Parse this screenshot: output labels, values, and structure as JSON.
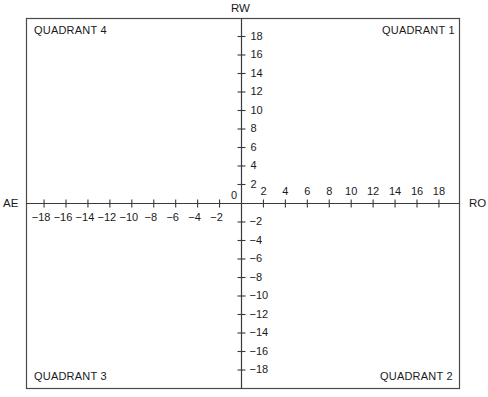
{
  "chart_data": {
    "type": "scatter",
    "title": "",
    "xlabel_positive": "RO",
    "xlabel_negative": "AE",
    "ylabel_positive": "RW",
    "origin_label": "0",
    "xlim": [
      -20,
      20
    ],
    "ylim": [
      -20,
      20
    ],
    "grid": false,
    "x_ticks_positive": [
      2,
      4,
      6,
      8,
      10,
      12,
      14,
      16,
      18
    ],
    "x_ticks_negative": [
      -18,
      -16,
      -14,
      -12,
      -10,
      -8,
      -6,
      -4,
      -2
    ],
    "y_ticks_positive": [
      2,
      4,
      6,
      8,
      10,
      12,
      14,
      16,
      18
    ],
    "y_ticks_negative": [
      -2,
      -4,
      -6,
      -8,
      -10,
      -12,
      -14,
      -16,
      -18
    ],
    "x_tick_labels_positive": [
      "2",
      "4",
      "6",
      "8",
      "10",
      "12",
      "14",
      "16",
      "18"
    ],
    "x_tick_labels_negative": [
      "−18",
      "−16",
      "−14",
      "−12",
      "−10",
      "−8",
      "−6",
      "−4",
      "−2"
    ],
    "y_tick_labels_positive": [
      "2",
      "4",
      "6",
      "8",
      "10",
      "12",
      "14",
      "16",
      "18"
    ],
    "y_tick_labels_negative": [
      "−2",
      "−4",
      "−6",
      "−8",
      "−10",
      "−12",
      "−14",
      "−16",
      "−18"
    ],
    "annotations": [
      {
        "text": "QUADRANT 1",
        "position": "top-right"
      },
      {
        "text": "QUADRANT 2",
        "position": "bottom-right"
      },
      {
        "text": "QUADRANT 3",
        "position": "bottom-left"
      },
      {
        "text": "QUADRANT 4",
        "position": "top-left"
      }
    ],
    "series": []
  },
  "labels": {
    "rw": "RW",
    "ro": "RO",
    "ae": "AE",
    "origin": "0",
    "quadrant_1": "QUADRANT  1",
    "quadrant_2": "QUADRANT  2",
    "quadrant_3": "QUADRANT  3",
    "quadrant_4": "QUADRANT  4"
  },
  "colors": {
    "line": "#3a3a3a",
    "text": "#1a1a1a",
    "background": "#ffffff"
  }
}
